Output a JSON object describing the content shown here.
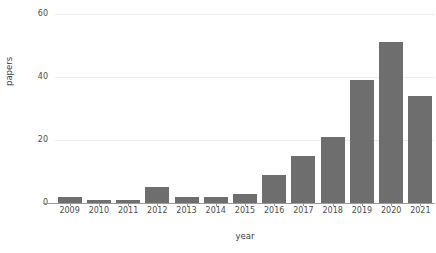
{
  "chart_data": {
    "type": "bar",
    "title": "",
    "subtitle": "",
    "xlabel": "year",
    "ylabel": "papers",
    "categories": [
      "2009",
      "2010",
      "2011",
      "2012",
      "2013",
      "2014",
      "2015",
      "2016",
      "2017",
      "2018",
      "2019",
      "2020",
      "2021"
    ],
    "values": [
      2,
      1,
      1,
      5,
      2,
      2,
      3,
      9,
      15,
      21,
      39,
      51,
      34
    ],
    "series": [
      {
        "name": "papers",
        "values": [
          2,
          1,
          1,
          5,
          2,
          2,
          3,
          9,
          15,
          21,
          39,
          51,
          34
        ]
      }
    ],
    "ylim": [
      0,
      62
    ],
    "yticks": [
      0,
      20,
      40,
      60
    ],
    "ytick_labels": [
      "0",
      "20",
      "40",
      "60"
    ],
    "xtick_labels": [
      "2009",
      "2010",
      "2011",
      "2012",
      "2013",
      "2014",
      "2015",
      "2016",
      "2017",
      "2018",
      "2019",
      "2020",
      "2021"
    ],
    "grid": true,
    "grid_axis": "y",
    "legend": false,
    "legend_position": "none",
    "bar_color": "#6e6e6e",
    "gridline_color": "#ededed",
    "axis_color": "#9a9a9a",
    "background_color": "#ffffff",
    "annotations": []
  }
}
